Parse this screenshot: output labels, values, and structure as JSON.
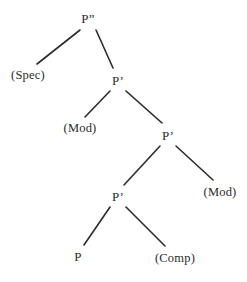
{
  "figure": {
    "kind": "syntax-tree",
    "background_color": "#ffffff",
    "line_color": "#2b2b2b",
    "text_color": "#2b2b2b",
    "width": 247,
    "height": 282
  },
  "chart_data": {
    "type": "diagram",
    "title": "",
    "nodes": [
      {
        "id": "n0",
        "label": "P”",
        "x": 88,
        "y": 18,
        "level": 0,
        "kind": "phrasal"
      },
      {
        "id": "n1",
        "label": "(Spec)",
        "x": 28,
        "y": 75,
        "level": 1,
        "kind": "slot"
      },
      {
        "id": "n2",
        "label": "P’",
        "x": 118,
        "y": 80,
        "level": 1,
        "kind": "phrasal"
      },
      {
        "id": "n3",
        "label": "(Mod)",
        "x": 80,
        "y": 128,
        "level": 2,
        "kind": "slot"
      },
      {
        "id": "n4",
        "label": "P’",
        "x": 168,
        "y": 135,
        "level": 2,
        "kind": "phrasal"
      },
      {
        "id": "n5",
        "label": "P’",
        "x": 118,
        "y": 196,
        "level": 3,
        "kind": "phrasal"
      },
      {
        "id": "n6",
        "label": "(Mod)",
        "x": 220,
        "y": 192,
        "level": 3,
        "kind": "slot"
      },
      {
        "id": "n7",
        "label": "P",
        "x": 78,
        "y": 256,
        "level": 4,
        "kind": "head"
      },
      {
        "id": "n8",
        "label": "(Comp)",
        "x": 175,
        "y": 258,
        "level": 4,
        "kind": "slot"
      }
    ],
    "edges": [
      {
        "from": "n0",
        "to": "n1",
        "x1": 80,
        "y1": 30,
        "x2": 37,
        "y2": 64
      },
      {
        "from": "n0",
        "to": "n2",
        "x1": 96,
        "y1": 30,
        "x2": 113,
        "y2": 68
      },
      {
        "from": "n2",
        "to": "n3",
        "x1": 110,
        "y1": 91,
        "x2": 85,
        "y2": 117
      },
      {
        "from": "n2",
        "to": "n4",
        "x1": 126,
        "y1": 91,
        "x2": 162,
        "y2": 123
      },
      {
        "from": "n4",
        "to": "n5",
        "x1": 160,
        "y1": 146,
        "x2": 124,
        "y2": 185
      },
      {
        "from": "n4",
        "to": "n6",
        "x1": 176,
        "y1": 146,
        "x2": 213,
        "y2": 180
      },
      {
        "from": "n5",
        "to": "n7",
        "x1": 110,
        "y1": 207,
        "x2": 84,
        "y2": 245
      },
      {
        "from": "n5",
        "to": "n8",
        "x1": 126,
        "y1": 207,
        "x2": 165,
        "y2": 246
      }
    ],
    "edge_width": 1.6
  }
}
